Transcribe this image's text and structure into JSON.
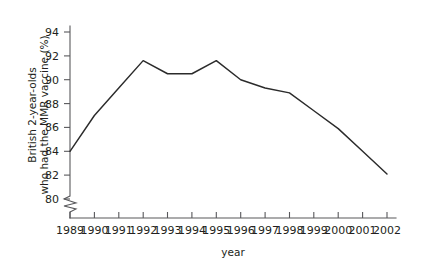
{
  "chart_data": {
    "type": "line",
    "title": "",
    "xlabel": "year",
    "ylabel": "British 2-year-olds who had the MMR vaccine (%)",
    "ylabel_line1": "British 2-year-olds",
    "ylabel_line2": "who had the MMR vaccine (%)",
    "categories": [
      1989,
      1990,
      1991,
      1992,
      1993,
      1994,
      1995,
      1996,
      1997,
      1998,
      1999,
      2000,
      2001,
      2002
    ],
    "x_tick_labels": [
      "1989",
      "1990",
      "1991",
      "1992",
      "1993",
      "1994",
      "1995",
      "1996",
      "1997",
      "1998",
      "1999",
      "2000",
      "2001",
      "2002"
    ],
    "values": [
      84.0,
      87.0,
      89.3,
      91.6,
      90.5,
      90.5,
      91.6,
      90.0,
      89.3,
      88.9,
      87.4,
      85.9,
      84.0,
      82.1
    ],
    "y_tick_labels": [
      "80",
      "82",
      "84",
      "86",
      "88",
      "90",
      "92",
      "94"
    ],
    "y_ticks": [
      80,
      82,
      84,
      86,
      88,
      90,
      92,
      94
    ],
    "ylim": [
      80,
      95
    ],
    "xlim": [
      1989,
      2002
    ],
    "axis_break": true,
    "axis_break_note": "zigzag break on y-axis below 80",
    "grid": false,
    "legend": false,
    "legend_position": "none",
    "series": [
      {
        "name": "MMR vaccine coverage",
        "color": "#2b2b2b",
        "values": [
          84.0,
          87.0,
          89.3,
          91.6,
          90.5,
          90.5,
          91.6,
          90.0,
          89.3,
          88.9,
          87.4,
          85.9,
          84.0,
          82.1
        ]
      }
    ]
  },
  "colors": {
    "line": "#2b2b2b",
    "axis": "#58585b",
    "text": "#231f20",
    "background": "#ffffff"
  }
}
